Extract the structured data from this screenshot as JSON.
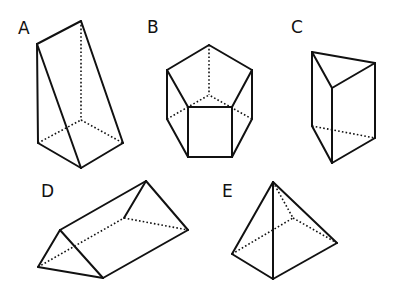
{
  "figure": {
    "colors": {
      "stroke": "#111111",
      "background": "#ffffff"
    }
  },
  "shapes": [
    {
      "label": "A",
      "type": "triangular-prism",
      "label_pos": [
        18,
        34
      ],
      "visible_edges": [
        [
          [
            37,
            44
          ],
          [
            81,
            21
          ]
        ],
        [
          [
            37,
            44
          ],
          [
            38,
            143
          ]
        ],
        [
          [
            37,
            44
          ],
          [
            81,
            168
          ]
        ],
        [
          [
            81,
            21
          ],
          [
            123,
            143
          ]
        ],
        [
          [
            38,
            143
          ],
          [
            81,
            168
          ]
        ],
        [
          [
            81,
            168
          ],
          [
            123,
            143
          ]
        ]
      ],
      "hidden_edges": [
        [
          [
            81,
            21
          ],
          [
            81,
            120
          ]
        ],
        [
          [
            38,
            143
          ],
          [
            81,
            120
          ]
        ],
        [
          [
            81,
            120
          ],
          [
            123,
            143
          ]
        ]
      ]
    },
    {
      "label": "B",
      "type": "pentagonal-prism",
      "label_pos": [
        147,
        33
      ],
      "visible_edges": [
        [
          [
            209,
            45
          ],
          [
            167,
            70
          ]
        ],
        [
          [
            209,
            45
          ],
          [
            252,
            70
          ]
        ],
        [
          [
            167,
            70
          ],
          [
            188,
            107
          ]
        ],
        [
          [
            252,
            70
          ],
          [
            232,
            107
          ]
        ],
        [
          [
            188,
            107
          ],
          [
            232,
            107
          ]
        ],
        [
          [
            167,
            70
          ],
          [
            167,
            119
          ]
        ],
        [
          [
            252,
            70
          ],
          [
            252,
            119
          ]
        ],
        [
          [
            188,
            107
          ],
          [
            188,
            157
          ]
        ],
        [
          [
            232,
            107
          ],
          [
            232,
            157
          ]
        ],
        [
          [
            167,
            119
          ],
          [
            188,
            157
          ]
        ],
        [
          [
            252,
            119
          ],
          [
            232,
            157
          ]
        ],
        [
          [
            188,
            157
          ],
          [
            232,
            157
          ]
        ]
      ],
      "hidden_edges": [
        [
          [
            209,
            45
          ],
          [
            209,
            95
          ]
        ],
        [
          [
            167,
            119
          ],
          [
            209,
            95
          ]
        ],
        [
          [
            252,
            119
          ],
          [
            209,
            95
          ]
        ]
      ]
    },
    {
      "label": "C",
      "type": "triangular-prism",
      "label_pos": [
        291,
        33
      ],
      "visible_edges": [
        [
          [
            312,
            52
          ],
          [
            375,
            63
          ]
        ],
        [
          [
            312,
            52
          ],
          [
            332,
            88
          ]
        ],
        [
          [
            375,
            63
          ],
          [
            332,
            88
          ]
        ],
        [
          [
            312,
            52
          ],
          [
            312,
            126
          ]
        ],
        [
          [
            375,
            63
          ],
          [
            375,
            138
          ]
        ],
        [
          [
            332,
            88
          ],
          [
            332,
            163
          ]
        ],
        [
          [
            312,
            126
          ],
          [
            332,
            163
          ]
        ],
        [
          [
            332,
            163
          ],
          [
            375,
            138
          ]
        ]
      ],
      "hidden_edges": [
        [
          [
            312,
            126
          ],
          [
            375,
            138
          ]
        ]
      ]
    },
    {
      "label": "D",
      "type": "triangular-prism",
      "label_pos": [
        41,
        197
      ],
      "visible_edges": [
        [
          [
            60,
            230
          ],
          [
            38,
            267
          ]
        ],
        [
          [
            60,
            230
          ],
          [
            103,
            278
          ]
        ],
        [
          [
            38,
            267
          ],
          [
            103,
            278
          ]
        ],
        [
          [
            60,
            230
          ],
          [
            146,
            181
          ]
        ],
        [
          [
            146,
            181
          ],
          [
            188,
            230
          ]
        ],
        [
          [
            103,
            278
          ],
          [
            188,
            230
          ]
        ],
        [
          [
            146,
            181
          ],
          [
            124,
            218
          ]
        ]
      ],
      "hidden_edges": [
        [
          [
            38,
            267
          ],
          [
            124,
            218
          ]
        ],
        [
          [
            124,
            218
          ],
          [
            188,
            230
          ]
        ]
      ]
    },
    {
      "label": "E",
      "type": "square-pyramid",
      "label_pos": [
        222,
        197
      ],
      "visible_edges": [
        [
          [
            273,
            182
          ],
          [
            232,
            254
          ]
        ],
        [
          [
            273,
            182
          ],
          [
            273,
            279
          ]
        ],
        [
          [
            273,
            182
          ],
          [
            337,
            243
          ]
        ],
        [
          [
            232,
            254
          ],
          [
            273,
            279
          ]
        ],
        [
          [
            273,
            279
          ],
          [
            337,
            243
          ]
        ]
      ],
      "hidden_edges": [
        [
          [
            273,
            182
          ],
          [
            293,
            218
          ]
        ],
        [
          [
            232,
            254
          ],
          [
            293,
            218
          ]
        ],
        [
          [
            293,
            218
          ],
          [
            337,
            243
          ]
        ]
      ]
    }
  ]
}
